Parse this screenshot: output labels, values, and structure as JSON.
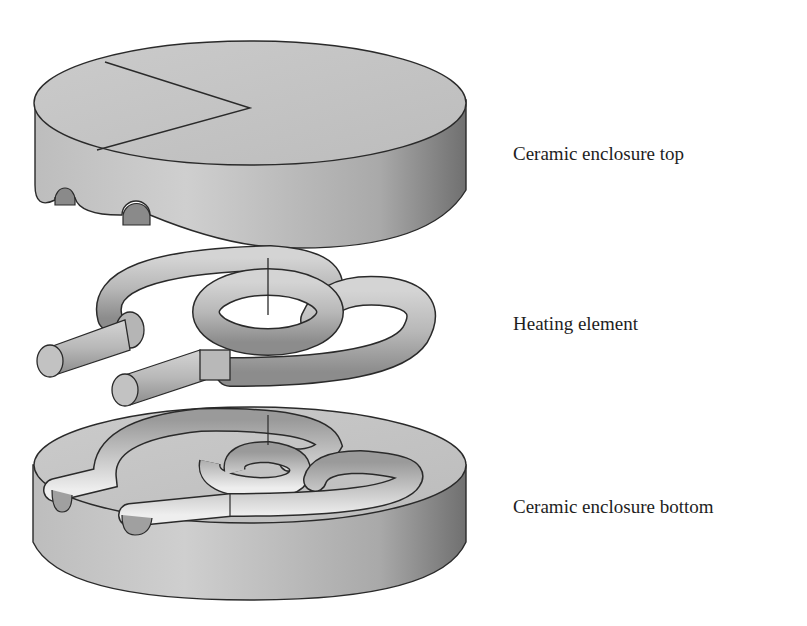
{
  "figure": {
    "type": "exploded-view",
    "components": [
      {
        "id": "top",
        "label": "Ceramic enclosure top"
      },
      {
        "id": "heating",
        "label": "Heating element"
      },
      {
        "id": "bottom",
        "label": "Ceramic enclosure bottom"
      }
    ]
  },
  "colors": {
    "background": "#ffffff",
    "surface_light": "#c9c9c9",
    "surface_mid": "#b3b3b3",
    "surface_dark": "#7d7d7d",
    "outline": "#2a2a2a",
    "text": "#1e1e1e"
  }
}
